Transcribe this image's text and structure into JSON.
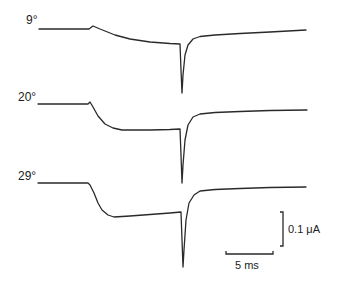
{
  "chart_data": {
    "type": "line",
    "title": "",
    "xlabel": "time",
    "ylabel": "current",
    "grid": false,
    "legend": "none",
    "series": [
      {
        "name": "9°",
        "label": "9°",
        "color": "#2a2a2a",
        "points": [
          [
            39,
            29
          ],
          [
            89,
            29
          ],
          [
            93,
            26
          ],
          [
            100,
            29
          ],
          [
            115,
            35
          ],
          [
            130,
            39
          ],
          [
            150,
            42
          ],
          [
            170,
            43.5
          ],
          [
            180,
            44
          ],
          [
            181,
            70
          ],
          [
            182,
            93
          ],
          [
            183,
            75
          ],
          [
            185,
            55
          ],
          [
            188,
            45
          ],
          [
            193,
            39
          ],
          [
            200,
            36.5
          ],
          [
            215,
            35
          ],
          [
            240,
            33.5
          ],
          [
            270,
            32
          ],
          [
            306,
            30
          ]
        ]
      },
      {
        "name": "20°",
        "label": "20°",
        "color": "#2a2a2a",
        "points": [
          [
            38,
            104
          ],
          [
            88,
            104
          ],
          [
            90,
            102
          ],
          [
            93,
            107
          ],
          [
            98,
            116
          ],
          [
            105,
            124
          ],
          [
            113,
            128
          ],
          [
            122,
            130
          ],
          [
            150,
            130
          ],
          [
            170,
            129.5
          ],
          [
            180,
            129
          ],
          [
            181,
            155
          ],
          [
            182,
            183
          ],
          [
            183,
            165
          ],
          [
            185,
            140
          ],
          [
            188,
            125
          ],
          [
            193,
            117
          ],
          [
            200,
            114
          ],
          [
            215,
            112.5
          ],
          [
            240,
            111.5
          ],
          [
            270,
            110.5
          ],
          [
            307,
            110
          ]
        ]
      },
      {
        "name": "29°",
        "label": "29°",
        "color": "#2a2a2a",
        "points": [
          [
            38,
            183
          ],
          [
            88,
            183
          ],
          [
            90,
            185
          ],
          [
            94,
            193
          ],
          [
            98,
            203
          ],
          [
            102,
            210
          ],
          [
            108,
            215
          ],
          [
            114,
            217
          ],
          [
            130,
            216
          ],
          [
            150,
            214.5
          ],
          [
            170,
            213
          ],
          [
            181,
            212
          ],
          [
            182,
            240
          ],
          [
            183,
            267
          ],
          [
            184,
            250
          ],
          [
            186,
            220
          ],
          [
            189,
            203
          ],
          [
            194,
            195
          ],
          [
            200,
            191
          ],
          [
            215,
            189.5
          ],
          [
            240,
            188.5
          ],
          [
            270,
            187.5
          ],
          [
            306,
            187
          ]
        ]
      }
    ],
    "annotations": [
      {
        "text": "9°",
        "x": 26,
        "y": 24
      },
      {
        "text": "20°",
        "x": 18,
        "y": 101
      },
      {
        "text": "29°",
        "x": 18,
        "y": 180
      }
    ],
    "scale_bars": {
      "vertical": {
        "label": "0.1 μA",
        "x": 283,
        "y1": 212,
        "y2": 246
      },
      "horizontal": {
        "label": "5 ms",
        "x1": 226,
        "x2": 273,
        "y": 254
      }
    }
  },
  "labels": {
    "trace_9": "9°",
    "trace_20": "20°",
    "trace_29": "29°",
    "scale_current": "0.1 μA",
    "scale_time": "5 ms"
  }
}
